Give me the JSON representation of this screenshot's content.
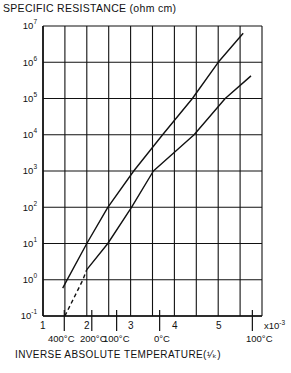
{
  "chart_data": {
    "type": "line",
    "title": "SPECIFIC RESISTANCE (ohm cm)",
    "xlabel": "INVERSE ABSOLUTE TEMPERATURE (1/K)",
    "ylabel": "SPECIFIC RESISTANCE (ohm cm)",
    "x_multiplier_label": "x10^-3",
    "xlim": [
      1,
      6
    ],
    "ylim": [
      0.1,
      10000000
    ],
    "yscale": "log",
    "grid": true,
    "x_ticks": [
      "1",
      "2",
      "3",
      "4",
      "5"
    ],
    "y_ticks": [
      "10^-1",
      "10^0",
      "10^1",
      "10^2",
      "10^3",
      "10^4",
      "10^5",
      "10^6",
      "10^7"
    ],
    "temperature_ticks": [
      {
        "label": "400°C",
        "x": 1.486
      },
      {
        "label": "200°C",
        "x": 2.114
      },
      {
        "label": "100°C",
        "x": 2.681
      },
      {
        "label": "0°C",
        "x": 3.663
      },
      {
        "label": "100°C",
        "x": 5.78
      }
    ],
    "series": [
      {
        "name": "upper curve",
        "style": "solid",
        "points": [
          [
            1.45,
            0.59
          ],
          [
            1.55,
            1
          ],
          [
            2.0,
            10
          ],
          [
            2.48,
            100
          ],
          [
            3.07,
            1000
          ],
          [
            3.73,
            10000
          ],
          [
            4.41,
            100000
          ],
          [
            5.0,
            1000000
          ],
          [
            5.57,
            6300000
          ]
        ]
      },
      {
        "name": "lower curve (extrapolated)",
        "style": "dashed",
        "points": [
          [
            1.5,
            0.1
          ],
          [
            1.91,
            1
          ],
          [
            2.0,
            1.9
          ]
        ]
      },
      {
        "name": "lower curve",
        "style": "solid",
        "points": [
          [
            2.0,
            1.9
          ],
          [
            2.48,
            10
          ],
          [
            3.02,
            100
          ],
          [
            3.52,
            1000
          ],
          [
            4.45,
            10000
          ],
          [
            5.16,
            100000
          ],
          [
            5.75,
            420000
          ]
        ]
      }
    ]
  },
  "labels": {
    "title": "SPECIFIC RESISTANCE (ohm cm)",
    "y": [
      {
        "base": "10",
        "exp": "7"
      },
      {
        "base": "10",
        "exp": "6"
      },
      {
        "base": "10",
        "exp": "5"
      },
      {
        "base": "10",
        "exp": "4"
      },
      {
        "base": "10",
        "exp": "3"
      },
      {
        "base": "10",
        "exp": "2"
      },
      {
        "base": "10",
        "exp": "1"
      },
      {
        "base": "10",
        "exp": "0"
      },
      {
        "base": "10",
        "exp": "-1"
      }
    ],
    "x": [
      "1",
      "2",
      "3",
      "4",
      "5"
    ],
    "x_exp_base": "x10",
    "x_exp_power": "-3",
    "temps": [
      "400°C",
      "200°C",
      "100°C",
      "0°C",
      "100°C"
    ],
    "xtitle": "INVERSE ABSOLUTE TEMPERATURE(¹⁄ₖ)"
  }
}
